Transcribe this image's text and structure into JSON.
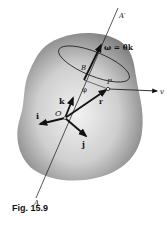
{
  "figure": {
    "caption": "Fig. 15.9",
    "labels": {
      "axis_top": "A′",
      "axis_bottom": "A",
      "omega": "ω = θ̇k",
      "point_B": "B",
      "point_P": "P",
      "angle_phi": "φ",
      "vector_r": "r",
      "vector_v": "v",
      "unit_k": "k",
      "unit_i": "i",
      "unit_j": "j",
      "origin": "O"
    },
    "colors": {
      "body_shade": "#8a8a8a",
      "body_light": "#f0f0f0",
      "ink": "#111111"
    }
  }
}
